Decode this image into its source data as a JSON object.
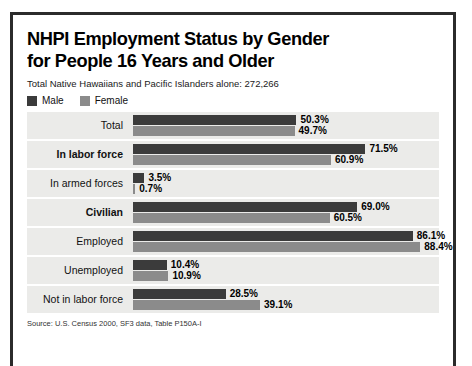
{
  "frame": {
    "title_line1": "NHPI Employment Status by Gender",
    "title_line2": "for People 16 Years and Older",
    "subtitle": "Total Native Hawaiians and Pacific Islanders alone: 272,266",
    "source": "Source: U.S. Census 2000, SF3 data, Table P150A-I"
  },
  "legend": {
    "items": [
      {
        "label": "Male",
        "color": "#3b3b3b",
        "swatch_name": "legend-swatch-male"
      },
      {
        "label": "Female",
        "color": "#8b8b8b",
        "swatch_name": "legend-swatch-female"
      }
    ]
  },
  "chart_data": {
    "type": "bar",
    "orientation": "horizontal",
    "title": "NHPI Employment Status by Gender for People 16 Years and Older",
    "subtitle": "Total Native Hawaiians and Pacific Islanders alone: 272,266",
    "xlabel": "",
    "ylabel": "",
    "xlim": [
      0,
      100
    ],
    "unit": "percent",
    "grid": false,
    "legend_position": "top-left",
    "categories": [
      "Total",
      "In labor force",
      "In armed forces",
      "Civilian",
      "Employed",
      "Unemployed",
      "Not in labor force"
    ],
    "series": [
      {
        "name": "Male",
        "color": "#3b3b3b",
        "values": [
          50.3,
          71.5,
          3.5,
          69.0,
          86.1,
          10.4,
          28.5
        ]
      },
      {
        "name": "Female",
        "color": "#8b8b8b",
        "values": [
          49.7,
          60.9,
          0.7,
          60.5,
          88.4,
          10.9,
          39.1
        ]
      }
    ],
    "rows": [
      {
        "label": "Total",
        "bold": false,
        "indent": false,
        "male": 50.3,
        "female": 49.7,
        "male_text": "50.3%",
        "female_text": "49.7%"
      },
      {
        "label": "In labor force",
        "bold": true,
        "indent": false,
        "male": 71.5,
        "female": 60.9,
        "male_text": "71.5%",
        "female_text": "60.9%"
      },
      {
        "label": "In armed forces",
        "bold": false,
        "indent": true,
        "male": 3.5,
        "female": 0.7,
        "male_text": "3.5%",
        "female_text": "0.7%"
      },
      {
        "label": "Civilian",
        "bold": true,
        "indent": false,
        "male": 69.0,
        "female": 60.5,
        "male_text": "69.0%",
        "female_text": "60.5%"
      },
      {
        "label": "Employed",
        "bold": false,
        "indent": false,
        "male": 86.1,
        "female": 88.4,
        "male_text": "86.1%",
        "female_text": "88.4%"
      },
      {
        "label": "Unemployed",
        "bold": false,
        "indent": false,
        "male": 10.4,
        "female": 10.9,
        "male_text": "10.4%",
        "female_text": "10.9%"
      },
      {
        "label": "Not in labor force",
        "bold": false,
        "indent": false,
        "male": 28.5,
        "female": 39.1,
        "male_text": "28.5%",
        "female_text": "39.1%"
      }
    ]
  }
}
